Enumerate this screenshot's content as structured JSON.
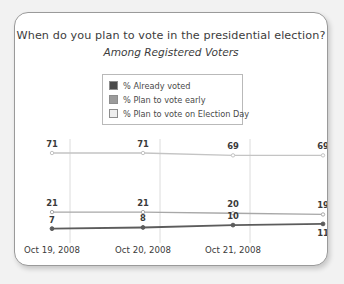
{
  "card": {
    "title": "When do you plan to vote in the presidential election?",
    "subtitle": "Among Registered Voters"
  },
  "legend": {
    "items": [
      {
        "label": "% Already voted",
        "color": "#4a4a4a",
        "name": "legend-already-voted"
      },
      {
        "label": "% Plan to vote early",
        "color": "#9b9b9b",
        "name": "legend-vote-early"
      },
      {
        "label": "% Plan to vote on Election Day",
        "color": "#eeeeee",
        "name": "legend-vote-election-day"
      }
    ]
  },
  "chart_data": {
    "type": "line",
    "title": "When do you plan to vote in the presidential election?",
    "subtitle": "Among Registered Voters",
    "xlabel": "",
    "ylabel": "",
    "grid": true,
    "legend_position": "top-center",
    "x": [
      "Oct 19, 2008",
      "Oct 20, 2008",
      "Oct 21, 2008",
      ""
    ],
    "xtick_labels": [
      "Oct 19, 2008",
      "Oct 20, 2008",
      "Oct 21, 2008"
    ],
    "ylim": [
      0,
      80
    ],
    "series": [
      {
        "name": "% Plan to vote on Election Day",
        "color": "#c4c4c4",
        "values": [
          71,
          71,
          69,
          69
        ],
        "labels": [
          "71",
          "71",
          "69",
          "69"
        ],
        "label_position": "above"
      },
      {
        "name": "% Plan to vote early",
        "color": "#a8a8a8",
        "values": [
          21,
          21,
          20,
          19
        ],
        "labels": [
          "21",
          "21",
          "20",
          "19"
        ],
        "label_position": "above"
      },
      {
        "name": "% Already voted",
        "color": "#5c5c5c",
        "values": [
          7,
          8,
          10,
          11
        ],
        "labels": [
          "7",
          "8",
          "10",
          "11"
        ],
        "label_position": "above-except-last"
      }
    ]
  }
}
